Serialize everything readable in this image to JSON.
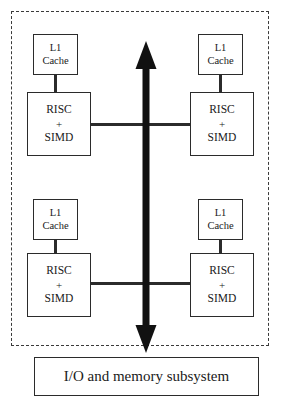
{
  "diagram": {
    "type": "block-diagram",
    "colors": {
      "box_border": "#2b2b2b",
      "boundary_dashed": "#3a3a3a",
      "bus_arrow": "#111111",
      "background": "#ffffff",
      "text": "#1a1a1a"
    },
    "chip_boundary": {
      "label": "chip die boundary",
      "style": "dashed"
    },
    "cores": [
      {
        "id": "upper-left",
        "cache": {
          "line1": "L1",
          "line2": "Cache"
        },
        "core": {
          "line1": "RISC",
          "line2": "+",
          "line3": "SIMD"
        }
      },
      {
        "id": "upper-right",
        "cache": {
          "line1": "L1",
          "line2": "Cache"
        },
        "core": {
          "line1": "RISC",
          "line2": "+",
          "line3": "SIMD"
        }
      },
      {
        "id": "lower-left",
        "cache": {
          "line1": "L1",
          "line2": "Cache"
        },
        "core": {
          "line1": "RISC",
          "line2": "+",
          "line3": "SIMD"
        }
      },
      {
        "id": "lower-right",
        "cache": {
          "line1": "L1",
          "line2": "Cache"
        },
        "core": {
          "line1": "RISC",
          "line2": "+",
          "line3": "SIMD"
        }
      }
    ],
    "bus": {
      "label": "central bidirectional bus",
      "direction": "bidirectional-vertical"
    },
    "subsystem": {
      "label": "I/O and memory subsystem"
    }
  }
}
